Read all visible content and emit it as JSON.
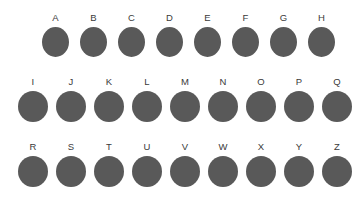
{
  "figure": {
    "background_color": "#ffffff",
    "dot_color": "#595959",
    "label_color": "#3a3a3a",
    "rows": [
      {
        "id": "row-1",
        "items": [
          {
            "label": "A"
          },
          {
            "label": "B"
          },
          {
            "label": "C"
          },
          {
            "label": "D"
          },
          {
            "label": "E"
          },
          {
            "label": "F"
          },
          {
            "label": "G"
          },
          {
            "label": "H"
          }
        ]
      },
      {
        "id": "row-2",
        "items": [
          {
            "label": "I"
          },
          {
            "label": "J"
          },
          {
            "label": "K"
          },
          {
            "label": "L"
          },
          {
            "label": "M"
          },
          {
            "label": "N"
          },
          {
            "label": "O"
          },
          {
            "label": "P"
          },
          {
            "label": "Q"
          }
        ]
      },
      {
        "id": "row-3",
        "items": [
          {
            "label": "R"
          },
          {
            "label": "S"
          },
          {
            "label": "T"
          },
          {
            "label": "U"
          },
          {
            "label": "V"
          },
          {
            "label": "W"
          },
          {
            "label": "X"
          },
          {
            "label": "Y"
          },
          {
            "label": "Z"
          }
        ]
      }
    ]
  }
}
